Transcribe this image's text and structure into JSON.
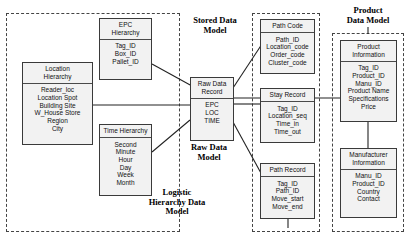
{
  "diagram": {
    "groups": [
      {
        "name": "logistic-hierarchy-data-model",
        "caption": "Logistic\nHierarchy Data\nModel",
        "caption_lines": [
          "Logistic",
          "Hierarchy Data",
          "Model"
        ]
      },
      {
        "name": "stored-data-model",
        "caption": "Stored Data\nModel",
        "caption_lines": [
          "Stored Data",
          "Model"
        ]
      },
      {
        "name": "raw-data-model",
        "caption": "Raw Data\nModel",
        "caption_lines": [
          "Raw Data",
          "Model"
        ]
      },
      {
        "name": "product-data-model",
        "caption": "Product\nData Model",
        "caption_lines": [
          "Product",
          "Data Model"
        ]
      }
    ],
    "entities": [
      {
        "name": "location-hierarchy",
        "header_lines": [
          "Location",
          "Hierarchy"
        ],
        "fields": [
          "Reader_loc",
          "Location Spot",
          "Building Site",
          "W_House Store",
          "Region",
          "City"
        ]
      },
      {
        "name": "epc-hierarchy",
        "header_lines": [
          "EPC",
          "Hierarchy"
        ],
        "fields": [
          "Tag_ID",
          "Box_ID",
          "Pallet_ID"
        ]
      },
      {
        "name": "time-hierarchy",
        "header_lines": [
          "Time Hierarchy"
        ],
        "fields": [
          "Second",
          "Minute",
          "Hour",
          "Day",
          "Week",
          "Month"
        ]
      },
      {
        "name": "raw-data-record",
        "header_lines": [
          "Raw Data",
          "Record"
        ],
        "fields": [
          "EPC",
          "LOC",
          "TIME"
        ]
      },
      {
        "name": "path-code",
        "header_lines": [
          "Path Code"
        ],
        "fields": [
          "Path_ID",
          "Location_code",
          "Order_code",
          "Cluster_code"
        ]
      },
      {
        "name": "stay-record",
        "header_lines": [
          "Stay Record"
        ],
        "fields": [
          "Tag_ID",
          "Location_seq",
          "Time_in",
          "Time_out"
        ]
      },
      {
        "name": "path-record",
        "header_lines": [
          "Path Record"
        ],
        "fields": [
          "Tag_ID",
          "Path_ID",
          "Move_start",
          "Move_end"
        ]
      },
      {
        "name": "product-information",
        "header_lines": [
          "Product",
          "Information"
        ],
        "fields": [
          "Tag_ID",
          "Product_ID",
          "Manu_ID",
          "Product Name",
          "Specifications",
          "Price"
        ]
      },
      {
        "name": "manufacturer-information",
        "header_lines": [
          "Manufacturer",
          "Information"
        ],
        "fields": [
          "Manu_ID",
          "Product_ID",
          "Country",
          "Contact"
        ]
      }
    ],
    "colors": {
      "entity_fill": "#f2f2f2",
      "entity_border": "#3a3a3a",
      "group_border": "#444444",
      "connector": "#222222",
      "text": "#111111"
    }
  }
}
